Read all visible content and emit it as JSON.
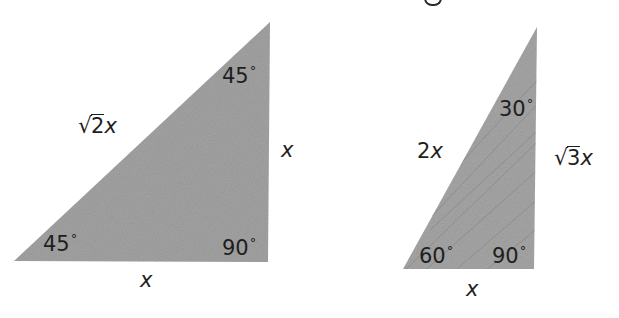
{
  "diagram": {
    "title_fragment": "g",
    "fill_color": "#a3a3a3",
    "streak_color": "#8a8a8a",
    "text_color": "#1e1e1e",
    "triangles": [
      {
        "name": "45-45-90 triangle",
        "vertices": [
          [
            14,
            261
          ],
          [
            268,
            262
          ],
          [
            270,
            22
          ]
        ],
        "angles": {
          "bottom_left": "45",
          "top": "45",
          "right_angle": "90"
        },
        "sides": {
          "hypotenuse": {
            "radicand": "2",
            "var": "x"
          },
          "vertical_leg": "x",
          "horizontal_leg": "x"
        }
      },
      {
        "name": "30-60-90 triangle",
        "vertices": [
          [
            403,
            269
          ],
          [
            534,
            269
          ],
          [
            537,
            27
          ]
        ],
        "angles": {
          "bottom_left": "60",
          "top": "30",
          "right_angle": "90"
        },
        "sides": {
          "hypotenuse": {
            "coef": "2",
            "var": "x"
          },
          "vertical_leg": {
            "radicand": "3",
            "var": "x"
          },
          "horizontal_leg": "x"
        }
      }
    ],
    "degree_symbol": "°",
    "radical_symbol": "√"
  }
}
